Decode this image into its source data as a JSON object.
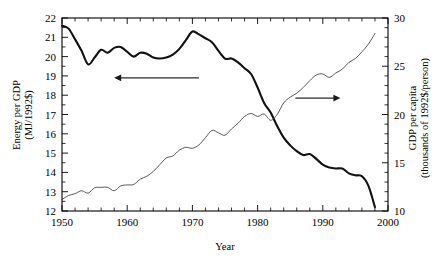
{
  "chart_data": {
    "type": "line",
    "title": "",
    "xlabel": "Year",
    "xlim": [
      1950,
      2000
    ],
    "x_major_ticks": [
      1950,
      1960,
      1970,
      1980,
      1990,
      2000
    ],
    "x_major_tick_labels": [
      "1950",
      "1960",
      "1970",
      "1980",
      "1990",
      "2000"
    ],
    "x_minor_tick_step": 2,
    "grid": false,
    "legend": "none",
    "annotations": [
      {
        "name": "left-arrow-annotation",
        "direction": "left",
        "points_to_series": "Energy per GDP",
        "x_range": [
          1958,
          1971
        ],
        "y_value_left_axis": 18.9
      },
      {
        "name": "right-arrow-annotation",
        "direction": "right",
        "points_to_series": "GDP per capita",
        "x_range": [
          1985.8,
          1992.7
        ],
        "y_value_left_axis": 17.85
      }
    ],
    "axes": [
      {
        "name": "left-axis",
        "position": "left",
        "label": "Energy per GDP",
        "label_line2": "(MJ/1992$)",
        "label_full": "Energy per GDP (MJ/1992$)",
        "ylim": [
          12,
          22
        ],
        "major_ticks": [
          12,
          13,
          14,
          15,
          16,
          17,
          18,
          19,
          20,
          21,
          22
        ],
        "major_tick_labels": [
          "12",
          "13",
          "14",
          "15",
          "16",
          "17",
          "18",
          "19",
          "20",
          "21",
          "22"
        ],
        "minor_tick_step": 0.5
      },
      {
        "name": "right-axis",
        "position": "right",
        "label": "GDP per capita",
        "label_line2": "(thousands of 1992$/person)",
        "label_full": "GDP per capita (thousands of 1992$/person)",
        "ylim": [
          10,
          30
        ],
        "major_ticks": [
          10,
          15,
          20,
          25,
          30
        ],
        "major_tick_labels": [
          "10",
          "15",
          "20",
          "25",
          "30"
        ],
        "minor_tick_step": 1
      }
    ],
    "series": [
      {
        "name": "Energy per GDP",
        "axis": "left",
        "units": "MJ per 1992 dollar",
        "style": "thick",
        "x": [
          1950,
          1951,
          1952,
          1953,
          1954,
          1955,
          1956,
          1957,
          1958,
          1959,
          1960,
          1961,
          1962,
          1963,
          1964,
          1965,
          1966,
          1967,
          1968,
          1969,
          1970,
          1971,
          1972,
          1973,
          1974,
          1975,
          1976,
          1977,
          1978,
          1979,
          1980,
          1981,
          1982,
          1983,
          1984,
          1985,
          1986,
          1987,
          1988,
          1989,
          1990,
          1991,
          1992,
          1993,
          1994,
          1995,
          1996,
          1997,
          1998
        ],
        "values": [
          21.6,
          21.45,
          20.9,
          20.3,
          19.6,
          19.95,
          20.35,
          20.2,
          20.45,
          20.5,
          20.25,
          20.0,
          20.2,
          20.15,
          19.95,
          19.9,
          19.95,
          20.1,
          20.4,
          20.85,
          21.3,
          21.15,
          20.95,
          20.75,
          20.3,
          19.9,
          19.9,
          19.7,
          19.4,
          19.1,
          18.4,
          17.6,
          17.1,
          16.4,
          15.8,
          15.4,
          15.1,
          14.9,
          14.95,
          14.7,
          14.4,
          14.25,
          14.2,
          14.2,
          13.95,
          13.85,
          13.8,
          13.3,
          12.2
        ]
      },
      {
        "name": "GDP per capita",
        "axis": "right",
        "units": "thousands of 1992 dollars per person",
        "style": "thin",
        "x": [
          1950,
          1951,
          1952,
          1953,
          1954,
          1955,
          1956,
          1957,
          1958,
          1959,
          1960,
          1961,
          1962,
          1963,
          1964,
          1965,
          1966,
          1967,
          1968,
          1969,
          1970,
          1971,
          1972,
          1973,
          1974,
          1975,
          1976,
          1977,
          1978,
          1979,
          1980,
          1981,
          1982,
          1983,
          1984,
          1985,
          1986,
          1987,
          1988,
          1989,
          1990,
          1991,
          1992,
          1993,
          1994,
          1995,
          1996,
          1997,
          1998
        ],
        "values": [
          11.2,
          11.6,
          11.8,
          12.1,
          11.85,
          12.4,
          12.45,
          12.45,
          12.1,
          12.6,
          12.7,
          12.75,
          13.3,
          13.6,
          14.1,
          14.8,
          15.5,
          15.7,
          16.3,
          16.6,
          16.5,
          16.85,
          17.6,
          18.35,
          18.1,
          17.85,
          18.5,
          19.1,
          19.8,
          20.1,
          19.8,
          20.05,
          19.4,
          20.0,
          21.2,
          21.8,
          22.2,
          22.8,
          23.5,
          24.1,
          24.2,
          23.85,
          24.3,
          24.7,
          25.4,
          25.8,
          26.5,
          27.3,
          28.4
        ]
      }
    ]
  }
}
